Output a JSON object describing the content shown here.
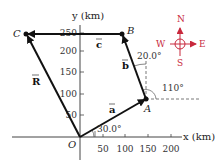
{
  "axes": {
    "x_label": "x (km)",
    "y_label": "y (km)",
    "origin_label": "O",
    "x_ticks": [
      "50",
      "100",
      "150",
      "200"
    ],
    "y_ticks": [
      "250",
      "200",
      "150",
      "100",
      "50"
    ]
  },
  "points": {
    "A": "A",
    "B": "B",
    "C": "C"
  },
  "vectors": {
    "a": "a",
    "b": "b",
    "c": "c",
    "R": "R"
  },
  "angles": {
    "a_angle": "30.0°",
    "b_angle": "20.0°",
    "ext_angle": "110°"
  },
  "compass": {
    "N": "N",
    "S": "S",
    "E": "E",
    "W": "W",
    "color": "#c8283c"
  },
  "colors": {
    "vector": "#111111",
    "axis": "#444444"
  }
}
